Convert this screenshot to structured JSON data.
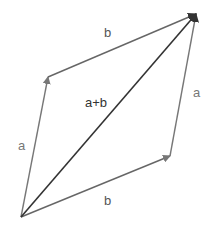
{
  "diagram": {
    "colors": {
      "background": "#ffffff",
      "side_vectors": "#777777",
      "resultant": "#333333",
      "side_labels": "#777777",
      "resultant_label": "#333333"
    },
    "points": {
      "origin": [
        21,
        217
      ],
      "a_tip": [
        48,
        77
      ],
      "b_tip": [
        170,
        156
      ],
      "sum_tip": [
        196,
        14
      ]
    },
    "vectors": [
      {
        "id": "a-left",
        "from": "origin",
        "to": "a_tip",
        "label": "a"
      },
      {
        "id": "b-top",
        "from": "a_tip",
        "to": "sum_tip",
        "label": "b"
      },
      {
        "id": "b-bottom",
        "from": "origin",
        "to": "b_tip",
        "label": "b"
      },
      {
        "id": "a-right",
        "from": "b_tip",
        "to": "sum_tip",
        "label": "a"
      },
      {
        "id": "resultant",
        "from": "origin",
        "to": "sum_tip",
        "label": "a+b"
      }
    ],
    "labels": {
      "top_b": "b",
      "left_a": "a",
      "right_a": "a",
      "bottom_b": "b",
      "resultant": "a+b"
    }
  }
}
